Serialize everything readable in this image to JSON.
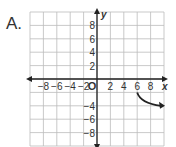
{
  "option_label": "A.",
  "chart_data": {
    "type": "line",
    "title": "",
    "xlabel": "x",
    "ylabel": "y",
    "xlim": [
      -10,
      10
    ],
    "ylim": [
      -10,
      10
    ],
    "grid": true,
    "x_ticks": [
      -8,
      -6,
      -4,
      -2,
      2,
      4,
      6,
      8
    ],
    "y_ticks": [
      8,
      6,
      4,
      2,
      -4,
      -6,
      -8
    ],
    "origin_label": "O",
    "series": [
      {
        "name": "curve",
        "points": [
          [
            6,
            -2
          ],
          [
            7,
            -3
          ],
          [
            8,
            -3.5
          ],
          [
            10,
            -4
          ]
        ],
        "end_arrow": true
      }
    ]
  }
}
